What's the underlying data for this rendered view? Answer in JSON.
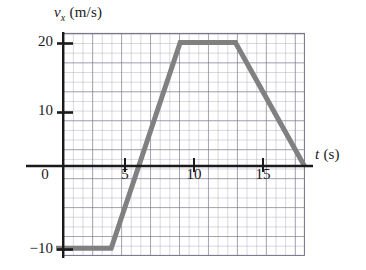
{
  "chart_data": {
    "type": "line",
    "title": "",
    "subtitle": "",
    "xlabel": "t (s)",
    "xlabel_symbol": "t",
    "xlabel_unit": "(s)",
    "ylabel": "v_x (m/s)",
    "ylabel_symbol": "v",
    "ylabel_subscript": "x",
    "ylabel_unit": "(m/s)",
    "xlim": [
      -0.5,
      17.5
    ],
    "ylim": [
      -16,
      21
    ],
    "xticks": [
      0,
      5,
      10,
      15
    ],
    "yticks": [
      -10,
      10,
      20
    ],
    "xtick_labels": [
      "0",
      "5",
      "10",
      "15"
    ],
    "ytick_labels": [
      "−10",
      "10",
      "20"
    ],
    "grid": true,
    "grid_minor_step_x": 0.725,
    "grid_minor_step_y": 1.45,
    "legend": "none",
    "series": [
      {
        "name": "v_x",
        "color": "#808080",
        "linewidth": 5,
        "x": [
          0,
          4,
          9,
          13,
          18
        ],
        "values": [
          -12,
          -12,
          18,
          18,
          0
        ],
        "points": [
          {
            "t": 0,
            "v": -12
          },
          {
            "t": 4,
            "v": -12
          },
          {
            "t": 9,
            "v": 18
          },
          {
            "t": 13,
            "v": 18
          },
          {
            "t": 18,
            "v": 0
          }
        ]
      }
    ],
    "annotations": [],
    "colors": {
      "line": "#808080",
      "axis": "#1a1a1a",
      "grid": "#a9a9bb",
      "background": "#ffffff",
      "text": "#1a1a1a"
    }
  }
}
